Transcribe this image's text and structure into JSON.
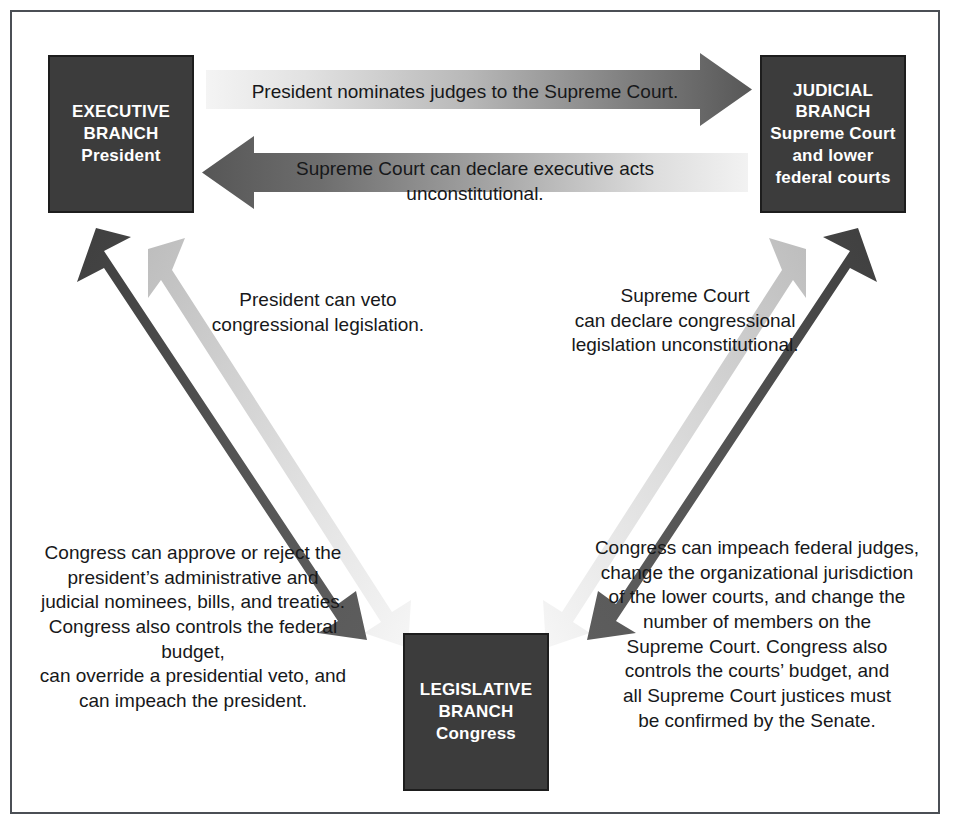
{
  "diagram": {
    "frame_border_color": "#4b4f55",
    "background_color": "#ffffff",
    "box_fill_color": "#3c3c3c",
    "box_text_color": "#ffffff",
    "arrow_dark_color": "#4d4d4d",
    "arrow_light_color": "#f2f2f2",
    "caption_text_color": "#17181a"
  },
  "boxes": {
    "executive": {
      "name": "executive-branch",
      "lines": [
        "EXECUTIVE",
        "BRANCH",
        "President"
      ]
    },
    "judicial": {
      "name": "judicial-branch",
      "lines": [
        "JUDICIAL",
        "BRANCH",
        "Supreme Court",
        "and lower",
        "federal courts"
      ]
    },
    "legislative": {
      "name": "legislative-branch",
      "lines": [
        "LEGISLATIVE",
        "BRANCH",
        "Congress"
      ]
    }
  },
  "captions": {
    "executive_to_judicial": "President nominates judges to the Supreme Court.",
    "judicial_to_executive": "Supreme Court can declare executive acts unconstitutional.",
    "executive_to_legislative": "President can veto\ncongressional legislation.",
    "judicial_to_legislative": "Supreme Court\ncan declare congressional\nlegislation unconstitutional.",
    "legislative_to_executive": "Congress can approve or reject the\npresident’s administrative and\njudicial nominees, bills, and treaties.\nCongress also controls the federal budget,\ncan override a presidential veto, and\ncan impeach the president.",
    "legislative_to_judicial": "Congress can impeach federal judges,\nchange the organizational jurisdiction\nof the lower courts, and change the\nnumber of members on the\nSupreme Court. Congress also\ncontrols the courts’ budget, and\nall Supreme Court justices must\nbe confirmed by the Senate."
  },
  "arrows": [
    {
      "name": "arrow-executive-to-judicial",
      "direction": "right",
      "from": "executive",
      "to": "judicial",
      "gradient": "light-to-dark"
    },
    {
      "name": "arrow-judicial-to-executive",
      "direction": "left",
      "from": "judicial",
      "to": "executive",
      "gradient": "light-to-dark"
    },
    {
      "name": "arrow-executive-to-legislative",
      "direction": "down-right",
      "from": "executive",
      "to": "legislative",
      "gradient": "dark"
    },
    {
      "name": "arrow-legislative-to-executive",
      "direction": "up-left",
      "from": "legislative",
      "to": "executive",
      "gradient": "light"
    },
    {
      "name": "arrow-judicial-to-legislative",
      "direction": "down-left",
      "from": "judicial",
      "to": "legislative",
      "gradient": "dark"
    },
    {
      "name": "arrow-legislative-to-judicial",
      "direction": "up-right",
      "from": "legislative",
      "to": "judicial",
      "gradient": "light"
    }
  ]
}
